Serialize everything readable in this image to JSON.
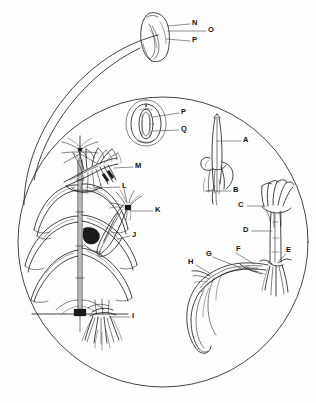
{
  "figure": {
    "background_color": "#fefefe",
    "ink_color": "#1a1a1a",
    "line_color": "#222222",
    "label_color": "#111111"
  },
  "frames": {
    "main_circle": {
      "cx": 163,
      "cy": 242,
      "r": 145
    },
    "callout_curve": "magnifier leader from main circle to top kernel inset",
    "kernel_inset": {
      "x": 140,
      "y": 10,
      "w": 36,
      "h": 52
    }
  },
  "labels": [
    {
      "id": "A",
      "text": "A",
      "x": 243,
      "y": 138,
      "target": "coleoptile-shoot",
      "leader": {
        "x1": 241,
        "y1": 141,
        "x2": 217,
        "y2": 141
      }
    },
    {
      "id": "B",
      "text": "B",
      "x": 233,
      "y": 188,
      "target": "seminal-root",
      "leader": {
        "x1": 231,
        "y1": 191,
        "x2": 206,
        "y2": 191
      }
    },
    {
      "id": "C",
      "text": "C",
      "x": 238,
      "y": 203,
      "target": "leaf-whorl",
      "leader": {
        "x1": 247,
        "y1": 206,
        "x2": 265,
        "y2": 206
      }
    },
    {
      "id": "D",
      "text": "D",
      "x": 243,
      "y": 228,
      "target": "stem-internode",
      "leader": {
        "x1": 252,
        "y1": 231,
        "x2": 272,
        "y2": 231
      }
    },
    {
      "id": "E",
      "text": "E",
      "x": 286,
      "y": 250,
      "target": "node-brace",
      "leader": {
        "x1": 286,
        "y1": 254,
        "x2": 276,
        "y2": 264
      }
    },
    {
      "id": "F",
      "text": "F",
      "x": 236,
      "y": 249,
      "target": "husk-leaf",
      "leader": {
        "x1": 236,
        "y1": 253,
        "x2": 254,
        "y2": 264
      }
    },
    {
      "id": "G",
      "text": "G",
      "x": 207,
      "y": 254,
      "target": "ear-shank",
      "leader": {
        "x1": 213,
        "y1": 257,
        "x2": 240,
        "y2": 268
      }
    },
    {
      "id": "H",
      "text": "H",
      "x": 189,
      "y": 262,
      "target": "ear-tip",
      "leader": {
        "x1": 196,
        "y1": 265,
        "x2": 210,
        "y2": 274
      }
    },
    {
      "id": "I",
      "text": "I",
      "x": 132,
      "y": 314,
      "target": "root-system",
      "leader": {
        "x1": 130,
        "y1": 317,
        "x2": 110,
        "y2": 317
      }
    },
    {
      "id": "J",
      "text": "J",
      "x": 132,
      "y": 233,
      "target": "ear-husk",
      "leader": {
        "x1": 130,
        "y1": 236,
        "x2": 118,
        "y2": 239
      }
    },
    {
      "id": "K",
      "text": "K",
      "x": 155,
      "y": 208,
      "target": "silk",
      "leader": {
        "x1": 153,
        "y1": 211,
        "x2": 130,
        "y2": 213
      }
    },
    {
      "id": "L",
      "text": "L",
      "x": 122,
      "y": 184,
      "target": "glume",
      "leader": {
        "x1": 120,
        "y1": 187,
        "x2": 95,
        "y2": 182
      }
    },
    {
      "id": "M",
      "text": "M",
      "x": 135,
      "y": 164,
      "target": "anther-spikelet",
      "leader": {
        "x1": 133,
        "y1": 167,
        "x2": 114,
        "y2": 168
      }
    },
    {
      "id": "N",
      "text": "N",
      "x": 192,
      "y": 21,
      "target": "pericarp",
      "leader": {
        "x1": 190,
        "y1": 24,
        "x2": 170,
        "y2": 26
      }
    },
    {
      "id": "O",
      "text": "O",
      "x": 208,
      "y": 28,
      "target": "endosperm",
      "leader": {
        "x1": 206,
        "y1": 31,
        "x2": 170,
        "y2": 31
      }
    },
    {
      "id": "P",
      "text": "P",
      "x": 192,
      "y": 38,
      "target": "embryo",
      "leader": {
        "x1": 190,
        "y1": 41,
        "x2": 170,
        "y2": 39
      }
    },
    {
      "id": "P2",
      "text": "P",
      "x": 181,
      "y": 110,
      "target": "embryo-section",
      "leader": {
        "x1": 179,
        "y1": 113,
        "x2": 157,
        "y2": 117
      }
    },
    {
      "id": "Q",
      "text": "Q",
      "x": 181,
      "y": 127,
      "target": "scutellum-section",
      "leader": {
        "x1": 179,
        "y1": 130,
        "x2": 157,
        "y2": 131
      }
    }
  ]
}
